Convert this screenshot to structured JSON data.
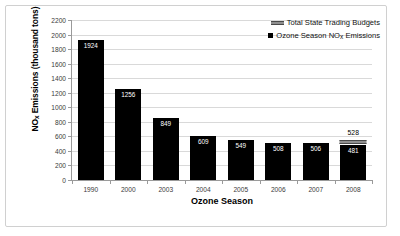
{
  "chart_data": {
    "type": "bar",
    "title": "",
    "xlabel": "Ozone Season",
    "ylabel_prefix": "NO",
    "ylabel_sub": "x",
    "ylabel_suffix": " Emissions (thousand tons)",
    "categories": [
      "1990",
      "2000",
      "2003",
      "2004",
      "2005",
      "2006",
      "2007",
      "2008"
    ],
    "series": [
      {
        "name": "Ozone Season NOx Emissions",
        "values": [
          1924,
          1256,
          849,
          609,
          549,
          508,
          506,
          481
        ],
        "color": "#000000"
      },
      {
        "name": "Total State Trading Budgets",
        "values": [
          null,
          null,
          null,
          null,
          null,
          null,
          null,
          528
        ],
        "color": "#8f8f8f"
      }
    ],
    "ylim": [
      0,
      2200
    ],
    "ytick_step": 200,
    "yticks": [
      "0",
      "200",
      "400",
      "600",
      "800",
      "1000",
      "1200",
      "1400",
      "1600",
      "1800",
      "2000",
      "2200"
    ],
    "grid": true,
    "legend_position": "top-right"
  },
  "legend": {
    "items": [
      {
        "label": "Total State Trading Budgets",
        "marker": "bar-marker",
        "color": "#8f8f8f"
      },
      {
        "label_prefix": "Ozone Season NO",
        "label_sub": "x",
        "label_suffix": " Emissions",
        "marker": "square-marker",
        "color": "#000000"
      }
    ]
  }
}
